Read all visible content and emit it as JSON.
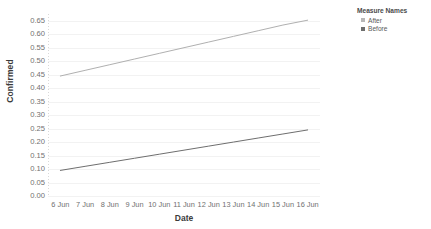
{
  "chart_data": {
    "type": "line",
    "title": "",
    "xlabel": "Date",
    "ylabel": "Confirmed",
    "x": [
      "6 Jun",
      "7 Jun",
      "8 Jun",
      "9 Jun",
      "10 Jun",
      "11 Jun",
      "12 Jun",
      "13 Jun",
      "14 Jun",
      "15 Jun",
      "16 Jun"
    ],
    "ylim": [
      0.0,
      0.675
    ],
    "yticks": [
      "0.00",
      "0.05",
      "0.10",
      "0.15",
      "0.20",
      "0.25",
      "0.30",
      "0.35",
      "0.40",
      "0.45",
      "0.50",
      "0.55",
      "0.60",
      "0.65"
    ],
    "ytick_values": [
      0.0,
      0.05,
      0.1,
      0.15,
      0.2,
      0.25,
      0.3,
      0.35,
      0.4,
      0.45,
      0.5,
      0.55,
      0.6,
      0.65
    ],
    "grid": true,
    "legend_position": "top-right",
    "series": [
      {
        "name": "After",
        "color": "#b0b0b0",
        "values": [
          0.445,
          0.466,
          0.487,
          0.508,
          0.529,
          0.55,
          0.571,
          0.592,
          0.613,
          0.634,
          0.652
        ]
      },
      {
        "name": "Before",
        "color": "#6e6e6e",
        "values": [
          0.095,
          0.11,
          0.125,
          0.14,
          0.155,
          0.17,
          0.185,
          0.2,
          0.215,
          0.23,
          0.245
        ]
      }
    ]
  },
  "legend": {
    "title": "Measure Names",
    "items": [
      {
        "label": "After",
        "color": "#b8b8b8"
      },
      {
        "label": "Before",
        "color": "#6e6e6e"
      }
    ]
  }
}
